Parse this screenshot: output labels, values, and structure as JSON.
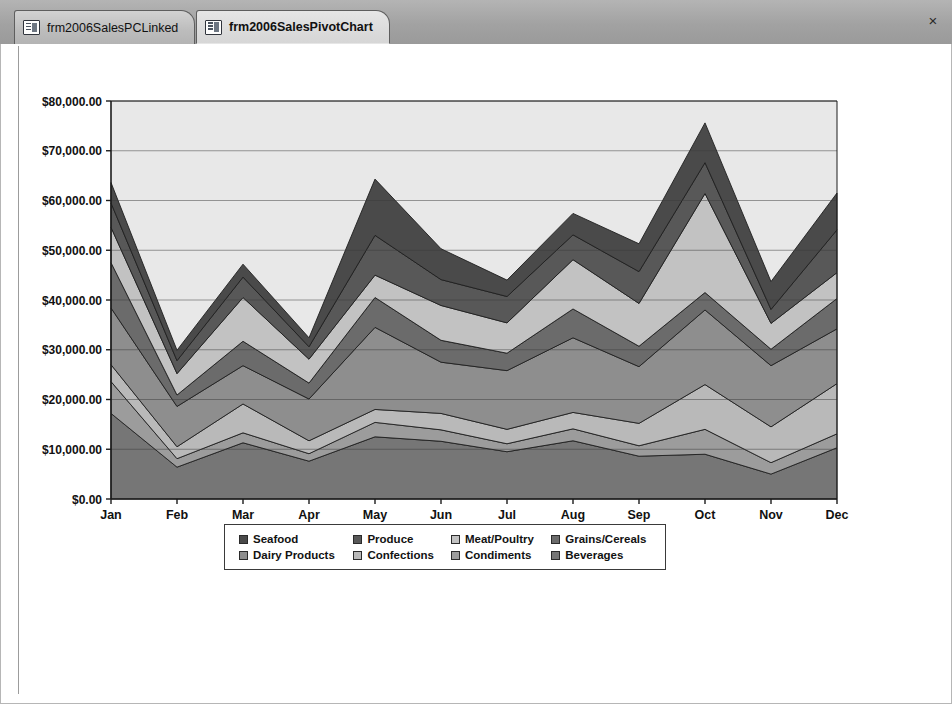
{
  "window": {
    "close_label": "×"
  },
  "tabs": [
    {
      "label": "frm2006SalesPCLinked",
      "active": false,
      "icon": "form-datasheet-icon"
    },
    {
      "label": "frm2006SalesPivotChart",
      "active": true,
      "icon": "form-datasheet-icon"
    }
  ],
  "legend": {
    "rows": [
      [
        {
          "label": "Seafood",
          "color": "#4a4a4a"
        },
        {
          "label": "Produce",
          "color": "#585858"
        },
        {
          "label": "Meat/Poultry",
          "color": "#c2c2c2"
        },
        {
          "label": "Grains/Cereals",
          "color": "#6b6b6b"
        }
      ],
      [
        {
          "label": "Dairy Products",
          "color": "#8e8e8e"
        },
        {
          "label": "Confections",
          "color": "#b9b9b9"
        },
        {
          "label": "Condiments",
          "color": "#9c9c9c"
        },
        {
          "label": "Beverages",
          "color": "#767676"
        }
      ]
    ]
  },
  "chart_data": {
    "type": "area",
    "stacked": true,
    "title": "",
    "xlabel": "",
    "ylabel": "",
    "grid": true,
    "legend_position": "bottom",
    "plot_background": "#e8e8e8",
    "axis_color": "#1c1c1c",
    "gridline_color": "#3c3c3c",
    "categories": [
      "Jan",
      "Feb",
      "Mar",
      "Apr",
      "May",
      "Jun",
      "Jul",
      "Aug",
      "Sep",
      "Oct",
      "Nov",
      "Dec"
    ],
    "ylim": [
      0,
      80000
    ],
    "ytick_step": 10000,
    "ytick_labels": [
      "$0.00",
      "$10,000.00",
      "$20,000.00",
      "$30,000.00",
      "$40,000.00",
      "$50,000.00",
      "$60,000.00",
      "$70,000.00",
      "$80,000.00"
    ],
    "stack_order_bottom_to_top": [
      "Beverages",
      "Condiments",
      "Confections",
      "Dairy Products",
      "Grains/Cereals",
      "Meat/Poultry",
      "Produce",
      "Seafood"
    ],
    "series": [
      {
        "name": "Beverages",
        "color": "#767676",
        "values": [
          17200,
          6400,
          11300,
          7600,
          12500,
          11600,
          9500,
          11700,
          8600,
          9000,
          5000,
          10300
        ]
      },
      {
        "name": "Condiments",
        "color": "#9c9c9c",
        "values": [
          6400,
          1700,
          2000,
          1500,
          2900,
          2300,
          1600,
          2400,
          2100,
          5000,
          2300,
          2800
        ]
      },
      {
        "name": "Confections",
        "color": "#b9b9b9",
        "values": [
          3400,
          2400,
          5800,
          2600,
          2600,
          3300,
          2900,
          3300,
          4500,
          9000,
          7200,
          10100
        ]
      },
      {
        "name": "Dairy Products",
        "color": "#8e8e8e",
        "values": [
          11400,
          8100,
          7700,
          8400,
          16500,
          10300,
          11800,
          15000,
          11400,
          15000,
          12300,
          11000
        ]
      },
      {
        "name": "Grains/Cereals",
        "color": "#6b6b6b",
        "values": [
          9100,
          2300,
          4900,
          3200,
          6000,
          4400,
          3500,
          5800,
          4100,
          3500,
          3300,
          6100
        ]
      },
      {
        "name": "Meat/Poultry",
        "color": "#c2c2c2",
        "values": [
          7100,
          4300,
          8800,
          4800,
          4500,
          7000,
          6100,
          9900,
          8600,
          19900,
          5200,
          5200
        ]
      },
      {
        "name": "Produce",
        "color": "#585858",
        "values": [
          4900,
          2600,
          4100,
          2500,
          8000,
          5200,
          5300,
          5000,
          6400,
          6200,
          2800,
          8600
        ]
      },
      {
        "name": "Seafood",
        "color": "#4a4a4a",
        "values": [
          4100,
          2100,
          2600,
          1800,
          11300,
          6200,
          3300,
          4300,
          5600,
          8000,
          5600,
          7400
        ]
      }
    ],
    "totals": [
      63600,
      29900,
      47200,
      32400,
      64300,
      50300,
      44000,
      57400,
      51300,
      75600,
      43700,
      61500
    ]
  }
}
